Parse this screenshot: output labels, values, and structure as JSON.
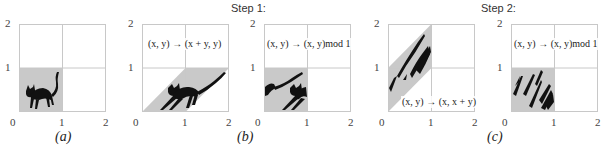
{
  "steps": [
    {
      "label": "Step 1:"
    },
    {
      "label": "Step 2:"
    }
  ],
  "axis": {
    "ticks": [
      "0",
      "1",
      "2"
    ]
  },
  "colors": {
    "grid": "#c8c8c8",
    "fill": "#c9c9c9",
    "cat": "#111111"
  },
  "panels": [
    {
      "id": "a",
      "caption": "(a)",
      "map_label": ""
    },
    {
      "id": "b1",
      "caption": "(b)",
      "map_label": "(x, y) → (x + y, y)"
    },
    {
      "id": "b2",
      "caption": "",
      "map_label": "(x, y) → (x, y)mod 1"
    },
    {
      "id": "c1",
      "caption": "(c)",
      "map_label": "(x, y) → (x, x + y)"
    },
    {
      "id": "c2",
      "caption": "",
      "map_label": "(x, y) → (x, y)mod 1"
    }
  ]
}
